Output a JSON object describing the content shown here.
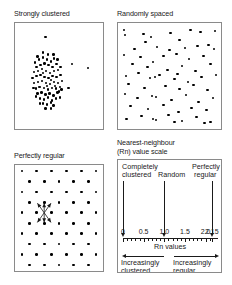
{
  "figure": {
    "panels": {
      "clustered": {
        "title": "Strongly clustered"
      },
      "random": {
        "title": "Randomly spaced"
      },
      "regular": {
        "title": "Perfectly regular"
      },
      "scale": {
        "title_line1": "Nearest-neighbour",
        "title_line2": "(Rn) value scale"
      }
    }
  },
  "scale": {
    "markers": [
      {
        "label_line1": "Completely",
        "label_line2": "clustered",
        "value": 0
      },
      {
        "label_line1": "Random",
        "label_line2": "",
        "value": 1.0
      },
      {
        "label_line1": "Perfectly",
        "label_line2": "regular",
        "value": 2.15
      }
    ],
    "tick_labels": [
      "0",
      "0.5",
      "1.0",
      "1.5",
      "2.0",
      "2.15"
    ],
    "tick_values": [
      0,
      0.5,
      1.0,
      1.5,
      2.0,
      2.15
    ],
    "axis_caption": "Rn values",
    "direction_left": {
      "line1": "Increasingly",
      "line2": "clustered"
    },
    "direction_right": {
      "line1": "Increasingly",
      "line2": "regular"
    }
  },
  "chart_data": {
    "type": "scatter",
    "xlabel": "",
    "ylabel": "",
    "xlim": [
      0,
      1
    ],
    "ylim": [
      0,
      1
    ],
    "grid": false,
    "legend": "none",
    "panels": [
      {
        "name": "clustered",
        "title": "Strongly clustered",
        "rn_value": 0,
        "points": [
          [
            0.33,
            0.1
          ],
          [
            0.66,
            0.38
          ],
          [
            0.86,
            0.42
          ],
          [
            0.62,
            0.62
          ],
          [
            0.4,
            0.83
          ],
          [
            0.2,
            0.36
          ],
          [
            0.25,
            0.33
          ],
          [
            0.3,
            0.31
          ],
          [
            0.35,
            0.33
          ],
          [
            0.4,
            0.35
          ],
          [
            0.44,
            0.32
          ],
          [
            0.22,
            0.41
          ],
          [
            0.27,
            0.39
          ],
          [
            0.32,
            0.37
          ],
          [
            0.37,
            0.39
          ],
          [
            0.42,
            0.41
          ],
          [
            0.47,
            0.38
          ],
          [
            0.19,
            0.46
          ],
          [
            0.24,
            0.45
          ],
          [
            0.29,
            0.43
          ],
          [
            0.34,
            0.45
          ],
          [
            0.39,
            0.47
          ],
          [
            0.44,
            0.45
          ],
          [
            0.49,
            0.44
          ],
          [
            0.17,
            0.52
          ],
          [
            0.22,
            0.5
          ],
          [
            0.27,
            0.49
          ],
          [
            0.32,
            0.51
          ],
          [
            0.37,
            0.52
          ],
          [
            0.42,
            0.5
          ],
          [
            0.47,
            0.51
          ],
          [
            0.52,
            0.49
          ],
          [
            0.19,
            0.57
          ],
          [
            0.24,
            0.56
          ],
          [
            0.29,
            0.55
          ],
          [
            0.34,
            0.57
          ],
          [
            0.39,
            0.58
          ],
          [
            0.44,
            0.56
          ],
          [
            0.49,
            0.57
          ],
          [
            0.54,
            0.55
          ],
          [
            0.21,
            0.63
          ],
          [
            0.26,
            0.61
          ],
          [
            0.31,
            0.62
          ],
          [
            0.36,
            0.64
          ],
          [
            0.41,
            0.62
          ],
          [
            0.46,
            0.63
          ],
          [
            0.51,
            0.61
          ],
          [
            0.23,
            0.68
          ],
          [
            0.28,
            0.67
          ],
          [
            0.33,
            0.69
          ],
          [
            0.38,
            0.68
          ],
          [
            0.43,
            0.7
          ],
          [
            0.48,
            0.67
          ],
          [
            0.26,
            0.73
          ],
          [
            0.31,
            0.74
          ],
          [
            0.36,
            0.72
          ],
          [
            0.41,
            0.75
          ],
          [
            0.46,
            0.73
          ],
          [
            0.3,
            0.78
          ],
          [
            0.35,
            0.79
          ],
          [
            0.4,
            0.77
          ],
          [
            0.23,
            0.3
          ],
          [
            0.36,
            0.28
          ],
          [
            0.45,
            0.6
          ],
          [
            0.5,
            0.66
          ],
          [
            0.18,
            0.62
          ],
          [
            0.21,
            0.71
          ],
          [
            0.26,
            0.78
          ],
          [
            0.33,
            0.83
          ],
          [
            0.43,
            0.8
          ],
          [
            0.51,
            0.72
          ],
          [
            0.53,
            0.64
          ],
          [
            0.52,
            0.41
          ],
          [
            0.48,
            0.33
          ],
          [
            0.43,
            0.28
          ],
          [
            0.3,
            0.26
          ],
          [
            0.25,
            0.61
          ],
          [
            0.35,
            0.6
          ],
          [
            0.4,
            0.54
          ],
          [
            0.3,
            0.47
          ]
        ]
      },
      {
        "name": "random",
        "title": "Randomly spaced",
        "rn_value": 1.0,
        "points": [
          [
            0.03,
            0.04
          ],
          [
            0.04,
            0.09
          ],
          [
            0.23,
            0.08
          ],
          [
            0.31,
            0.11
          ],
          [
            0.25,
            0.16
          ],
          [
            0.51,
            0.07
          ],
          [
            0.6,
            0.14
          ],
          [
            0.72,
            0.04
          ],
          [
            0.82,
            0.06
          ],
          [
            0.97,
            0.05
          ],
          [
            0.37,
            0.21
          ],
          [
            0.5,
            0.24
          ],
          [
            0.66,
            0.22
          ],
          [
            0.79,
            0.2
          ],
          [
            0.9,
            0.19
          ],
          [
            0.96,
            0.23
          ],
          [
            0.03,
            0.29
          ],
          [
            0.2,
            0.31
          ],
          [
            0.44,
            0.3
          ],
          [
            0.57,
            0.28
          ],
          [
            0.7,
            0.33
          ],
          [
            0.85,
            0.3
          ],
          [
            0.12,
            0.38
          ],
          [
            0.27,
            0.41
          ],
          [
            0.33,
            0.36
          ],
          [
            0.48,
            0.44
          ],
          [
            0.63,
            0.4
          ],
          [
            0.77,
            0.45
          ],
          [
            0.92,
            0.38
          ],
          [
            0.05,
            0.5
          ],
          [
            0.18,
            0.47
          ],
          [
            0.3,
            0.52
          ],
          [
            0.35,
            0.51
          ],
          [
            0.4,
            0.49
          ],
          [
            0.55,
            0.53
          ],
          [
            0.58,
            0.48
          ],
          [
            0.69,
            0.56
          ],
          [
            0.83,
            0.51
          ],
          [
            0.98,
            0.49
          ],
          [
            0.08,
            0.58
          ],
          [
            0.24,
            0.62
          ],
          [
            0.46,
            0.6
          ],
          [
            0.6,
            0.63
          ],
          [
            0.75,
            0.59
          ],
          [
            0.89,
            0.64
          ],
          [
            0.04,
            0.68
          ],
          [
            0.17,
            0.72
          ],
          [
            0.32,
            0.7
          ],
          [
            0.36,
            0.71
          ],
          [
            0.52,
            0.74
          ],
          [
            0.67,
            0.69
          ],
          [
            0.8,
            0.76
          ],
          [
            0.95,
            0.72
          ],
          [
            0.1,
            0.8
          ],
          [
            0.28,
            0.83
          ],
          [
            0.44,
            0.79
          ],
          [
            0.59,
            0.86
          ],
          [
            0.73,
            0.82
          ],
          [
            0.88,
            0.84
          ],
          [
            0.21,
            0.9
          ],
          [
            0.33,
            0.93
          ],
          [
            0.36,
            0.94
          ],
          [
            0.49,
            0.89
          ],
          [
            0.63,
            0.95
          ],
          [
            0.78,
            0.91
          ],
          [
            0.92,
            0.96
          ],
          [
            0.06,
            0.93
          ],
          [
            0.55,
            0.96
          ],
          [
            0.86,
            0.97
          ],
          [
            0.14,
            0.23
          ]
        ]
      },
      {
        "name": "regular",
        "title": "Perfectly regular",
        "rn_value": 2.15,
        "lattice": "triangular",
        "rows": 10,
        "cols": 6,
        "annotation": "six-nearest-neighbour star at lattice centre"
      }
    ]
  }
}
